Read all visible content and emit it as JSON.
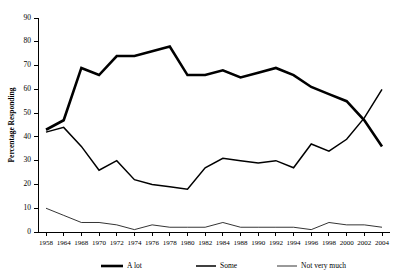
{
  "chart_data": {
    "type": "line",
    "title": "",
    "xlabel": "",
    "ylabel": "Percentage Responding",
    "ylim": [
      0,
      90
    ],
    "ytick_step": 10,
    "yticks": [
      0,
      10,
      20,
      30,
      40,
      50,
      60,
      70,
      80,
      90
    ],
    "grid": false,
    "legend_position": "bottom",
    "categories": [
      "1958",
      "1964",
      "1968",
      "1970",
      "1972",
      "1974",
      "1976",
      "1978",
      "1980",
      "1982",
      "1984",
      "1988",
      "1990",
      "1992",
      "1994",
      "1996",
      "1998",
      "2000",
      "2002",
      "2004"
    ],
    "series": [
      {
        "name": "A lot",
        "line_weight": "thick",
        "values": [
          43,
          47,
          69,
          66,
          74,
          74,
          76,
          78,
          66,
          66,
          68,
          65,
          67,
          69,
          66,
          61,
          58,
          55,
          47,
          36
        ]
      },
      {
        "name": "Some",
        "line_weight": "medium",
        "values": [
          42,
          44,
          36,
          26,
          30,
          22,
          20,
          19,
          18,
          27,
          31,
          30,
          29,
          30,
          27,
          37,
          34,
          39,
          48,
          60
        ]
      },
      {
        "name": "Not very much",
        "line_weight": "thin",
        "values": [
          10,
          7,
          4,
          4,
          3,
          1,
          3,
          2,
          2,
          2,
          4,
          2,
          2,
          2,
          2,
          1,
          4,
          3,
          3,
          2
        ]
      }
    ]
  },
  "legend": {
    "items": [
      {
        "label": "A lot"
      },
      {
        "label": "Some"
      },
      {
        "label": "Not very much"
      }
    ]
  }
}
